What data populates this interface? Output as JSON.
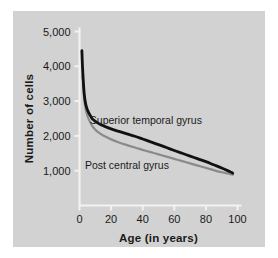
{
  "chart_data": {
    "type": "line",
    "title": "",
    "xlabel": "Age (in years)",
    "ylabel": "Number of cells",
    "xlim": [
      0,
      100
    ],
    "ylim": [
      0,
      5000
    ],
    "xticks": [
      0,
      20,
      40,
      60,
      80,
      100
    ],
    "xticklabels": [
      "0",
      "20",
      "40",
      "60",
      "80",
      "100"
    ],
    "yticks": [
      1000,
      2000,
      3000,
      4000,
      5000
    ],
    "yticklabels": [
      "1,000",
      "2,000",
      "3,000",
      "4,000",
      "5,000"
    ],
    "grid": false,
    "legend_position": "inline-annotation",
    "background_color": "#d2d2d2",
    "axis_color": "#f2f2f2",
    "series": [
      {
        "name": "Superior temporal gyrus",
        "color": "#111111",
        "label_x": 42,
        "label_y": 2450,
        "x": [
          1.5,
          2,
          3,
          4,
          5,
          6,
          8,
          10,
          12,
          15,
          20,
          25,
          30,
          35,
          40,
          45,
          50,
          55,
          60,
          65,
          70,
          75,
          80,
          85,
          90,
          95,
          97
        ],
        "values": [
          4450,
          3900,
          3200,
          2900,
          2750,
          2650,
          2500,
          2420,
          2360,
          2290,
          2200,
          2130,
          2060,
          1990,
          1910,
          1830,
          1750,
          1665,
          1580,
          1500,
          1420,
          1340,
          1260,
          1170,
          1080,
          975,
          930
        ]
      },
      {
        "name": "Post central gyrus",
        "color": "#8a8a8a",
        "label_x": 30,
        "label_y": 1150,
        "x": [
          2,
          3,
          4,
          5,
          6,
          8,
          10,
          12,
          15,
          20,
          25,
          30,
          35,
          40,
          45,
          50,
          55,
          60,
          65,
          70,
          75,
          80,
          85,
          90,
          95,
          97
        ],
        "values": [
          3750,
          3050,
          2750,
          2580,
          2460,
          2290,
          2180,
          2100,
          2010,
          1900,
          1810,
          1735,
          1665,
          1600,
          1535,
          1470,
          1405,
          1340,
          1275,
          1210,
          1145,
          1080,
          1015,
          955,
          905,
          885
        ]
      }
    ]
  }
}
